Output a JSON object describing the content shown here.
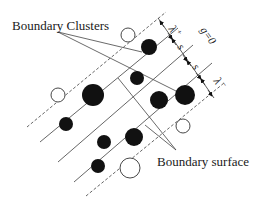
{
  "labels": {
    "boundary_clusters": "Boundary Clusters",
    "boundary_surface": "Boundary surface",
    "lambda_plus": "λ",
    "lambda_plus_sup": "+",
    "lambda_minus": "λ",
    "lambda_minus_sup": "−",
    "spacing_1": "s",
    "spacing_2": "s",
    "g_zero": "g=0"
  },
  "colors": {
    "ink": "#111111",
    "line": "#555555",
    "background": "#ffffff"
  },
  "lines": [
    {
      "id": "dashed-upper",
      "style": "dashed",
      "x1": 27,
      "y1": 127,
      "x2": 166,
      "y2": 12
    },
    {
      "id": "plane-1",
      "style": "solid",
      "x1": 40,
      "y1": 142,
      "x2": 178,
      "y2": 28
    },
    {
      "id": "plane-2",
      "style": "solid",
      "x1": 58,
      "y1": 162,
      "x2": 193,
      "y2": 45
    },
    {
      "id": "plane-3",
      "style": "solid",
      "x1": 74,
      "y1": 182,
      "x2": 212,
      "y2": 63
    },
    {
      "id": "dashed-lower",
      "style": "dashed",
      "x1": 86,
      "y1": 196,
      "x2": 224,
      "y2": 83
    }
  ],
  "filled_circles": [
    {
      "cx": 149,
      "cy": 47,
      "r": 8
    },
    {
      "cx": 137,
      "cy": 78,
      "r": 7
    },
    {
      "cx": 93,
      "cy": 95,
      "r": 11
    },
    {
      "cx": 159,
      "cy": 100,
      "r": 9
    },
    {
      "cx": 185,
      "cy": 95,
      "r": 10
    },
    {
      "cx": 66,
      "cy": 124,
      "r": 7
    },
    {
      "cx": 134,
      "cy": 137,
      "r": 9
    },
    {
      "cx": 104,
      "cy": 142,
      "r": 7
    },
    {
      "cx": 98,
      "cy": 166,
      "r": 7
    }
  ],
  "open_circles": [
    {
      "cx": 128,
      "cy": 35,
      "r": 7
    },
    {
      "cx": 58,
      "cy": 95,
      "r": 7
    },
    {
      "cx": 183,
      "cy": 126,
      "r": 7
    },
    {
      "cx": 130,
      "cy": 168,
      "r": 10
    }
  ]
}
